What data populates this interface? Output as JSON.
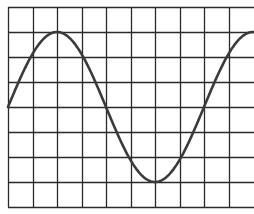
{
  "diagram": {
    "type": "sine-wave-on-grid",
    "colors": {
      "background": "#ffffff",
      "grid": "#2a2a2a",
      "wave": "#3a3a3a"
    },
    "grid": {
      "left": 8,
      "top": 7,
      "right": 254,
      "bottom": 207,
      "columns": 10,
      "rows": 8,
      "cell_width": 24.5,
      "cell_height": 25,
      "right_border": false
    },
    "wave": {
      "start_x": 8,
      "end_x": 254,
      "center_y": 107,
      "amplitude_px": 75,
      "period_px": 196,
      "phase": "starts at zero crossing going up",
      "peak": {
        "x": 57,
        "y": 32
      },
      "zero_crossing": {
        "x": 107,
        "y": 107
      },
      "trough": {
        "x": 155,
        "y": 182
      },
      "second_peak": {
        "x": 253,
        "y": 32
      }
    }
  }
}
